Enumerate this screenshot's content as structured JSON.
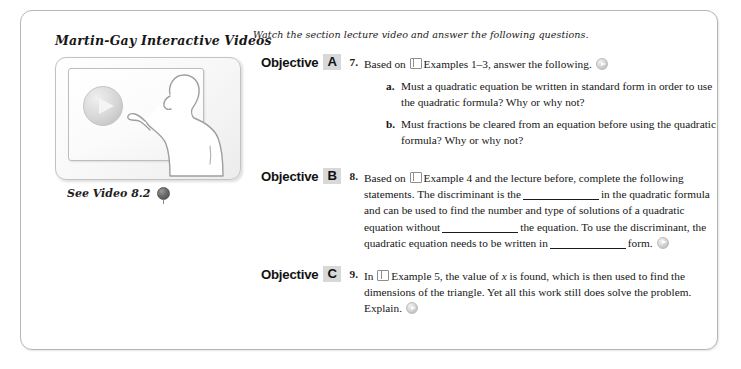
{
  "panel": {
    "video_section": {
      "heading": "Martin-Gay Interactive Videos",
      "caption": "See Video 8.2",
      "play_icon_name": "play-button-overlay",
      "ball_icon_name": "video-ball-icon"
    },
    "instruction": "Watch the section lecture video and answer the following questions.",
    "objective_word": "Objective",
    "exercises": [
      {
        "objective_letter": "A",
        "number": "7.",
        "text_before_icon": "Based on",
        "text_after_icon": "Examples 1–3, answer the following.",
        "has_example_icon": true,
        "has_play_icon": true,
        "subparts": [
          {
            "label": "a.",
            "text": "Must a quadratic equation be written in standard form in order to use the quadratic formula? Why or why not?"
          },
          {
            "label": "b.",
            "text": "Must fractions be cleared from an equation before using the quadratic formula? Why or why not?"
          }
        ]
      },
      {
        "objective_letter": "B",
        "number": "8.",
        "text_before_icon": "Based on",
        "text_segment_1": "Example 4 and the lecture before, complete the following statements. The discriminant is the",
        "text_segment_2": "in the quadratic formula and can be used to find the number and type of solutions of a quadratic equation without",
        "text_segment_3": "the equation. To use the discriminant, the quadratic equation needs to be written in",
        "text_segment_4": "form.",
        "blank_count": 3,
        "has_example_icon": true,
        "has_play_icon": true,
        "subparts": []
      },
      {
        "objective_letter": "C",
        "number": "9.",
        "text_before_icon": "In",
        "text_after_icon_a": "Example 5, the value of",
        "italic_variable": "x",
        "text_after_icon_b": "is found, which is then used to find the dimensions of the triangle. Yet all this work still does solve the problem. Explain.",
        "has_example_icon": true,
        "has_play_icon": true,
        "subparts": []
      }
    ]
  },
  "colors": {
    "panel_border": "#b6b6b6",
    "objective_tag_bg": "#d8d8d8",
    "text": "#1b1b1b",
    "icon_gray": "#8e8e8e"
  }
}
